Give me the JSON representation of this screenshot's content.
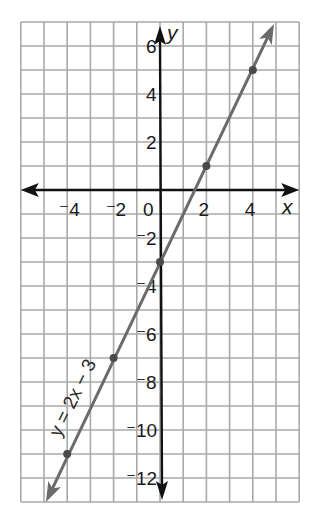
{
  "chart_data": {
    "type": "line",
    "title": "",
    "xlabel": "x",
    "ylabel": "y",
    "xlim": [
      -6,
      6
    ],
    "ylim": [
      -13,
      7
    ],
    "grid": true,
    "grid_step": 1,
    "x_ticks": [
      {
        "value": -4,
        "label": "⁻4"
      },
      {
        "value": -2,
        "label": "⁻2"
      },
      {
        "value": 0,
        "label": "0"
      },
      {
        "value": 2,
        "label": "2"
      },
      {
        "value": 4,
        "label": "4"
      }
    ],
    "y_ticks": [
      {
        "value": 6,
        "label": "6"
      },
      {
        "value": 4,
        "label": "4"
      },
      {
        "value": 2,
        "label": "2"
      },
      {
        "value": -2,
        "label": "⁻2"
      },
      {
        "value": -4,
        "label": "⁻4"
      },
      {
        "value": -6,
        "label": "⁻6"
      },
      {
        "value": -8,
        "label": "⁻8"
      },
      {
        "value": -10,
        "label": "⁻10"
      },
      {
        "value": -12,
        "label": "⁻12"
      }
    ],
    "series": [
      {
        "name": "y = 2x − 3",
        "equation": "y = 2x - 3",
        "slope": 2,
        "intercept": -3,
        "points": [
          {
            "x": -4,
            "y": -11
          },
          {
            "x": -2,
            "y": -7
          },
          {
            "x": 0,
            "y": -3
          },
          {
            "x": 2,
            "y": 1
          },
          {
            "x": 4,
            "y": 5
          }
        ],
        "extends_from": {
          "x": -5,
          "y": -13
        },
        "extends_to": {
          "x": 5,
          "y": 7
        }
      }
    ],
    "annotations": [
      {
        "text": "y = 2x − 3",
        "position": "along line, lower left",
        "rotation_deg": -64
      }
    ]
  },
  "labels": {
    "x_axis": "x",
    "y_axis": "y",
    "equation": "y = 2x − 3"
  },
  "colors": {
    "grid": "#a9a9a9",
    "axis": "#111111",
    "line": "#6b6b6b",
    "point": "#4a4a4a",
    "background": "#ffffff"
  }
}
